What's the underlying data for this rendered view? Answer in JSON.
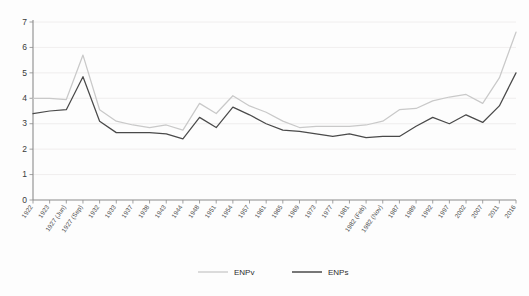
{
  "chart_data": {
    "type": "line",
    "title": "",
    "subtitle": "",
    "xlabel": "",
    "ylabel": "",
    "ylim": [
      0,
      7
    ],
    "ytick_labels": [
      "0",
      "1",
      "2",
      "3",
      "4",
      "5",
      "6",
      "7"
    ],
    "ytick_values": [
      0,
      1,
      2,
      3,
      4,
      5,
      6,
      7
    ],
    "grid": true,
    "legend_position": "bottom",
    "categories": [
      "1922",
      "1923",
      "1927 (Jun)",
      "1927 (Sep)",
      "1932",
      "1933",
      "1937",
      "1938",
      "1943",
      "1944",
      "1948",
      "1951",
      "1954",
      "1957",
      "1961",
      "1965",
      "1969",
      "1973",
      "1977",
      "1981",
      "1982 (Feb)",
      "1982 (Nov)",
      "1987",
      "1989",
      "1992",
      "1997",
      "2002",
      "2007",
      "2011",
      "2016"
    ],
    "series": [
      {
        "name": "ENPv",
        "color": "#c9c9c9",
        "values": [
          4.0,
          4.0,
          3.95,
          5.7,
          3.55,
          3.1,
          2.95,
          2.85,
          2.95,
          2.75,
          3.8,
          3.4,
          4.1,
          3.7,
          3.45,
          3.1,
          2.85,
          2.9,
          2.9,
          2.9,
          2.95,
          3.1,
          3.55,
          3.6,
          3.9,
          4.05,
          4.15,
          3.8,
          4.8,
          6.6
        ]
      },
      {
        "name": "ENPs",
        "color": "#4a4a4a",
        "values": [
          3.4,
          3.5,
          3.55,
          4.85,
          3.1,
          2.65,
          2.65,
          2.65,
          2.6,
          2.4,
          3.25,
          2.85,
          3.65,
          3.35,
          3.0,
          2.75,
          2.7,
          2.6,
          2.5,
          2.6,
          2.45,
          2.5,
          2.5,
          2.9,
          3.25,
          3.0,
          3.35,
          3.05,
          3.7,
          5.0
        ]
      }
    ],
    "legend": [
      {
        "label": "ENPv",
        "color": "#c9c9c9"
      },
      {
        "label": "ENPs",
        "color": "#4a4a4a"
      }
    ]
  }
}
